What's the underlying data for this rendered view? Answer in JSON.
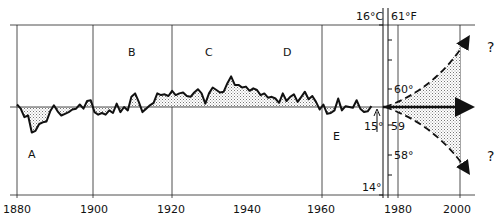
{
  "chart_data": {
    "type": "line",
    "title": "",
    "xlabel": "",
    "ylabel": "",
    "x_ticks": [
      "1880",
      "1900",
      "1920",
      "1940",
      "1960",
      "1980",
      "2000"
    ],
    "xlim": [
      1880,
      2000
    ],
    "celsius_axis": {
      "labels": [
        "16°C",
        "15°",
        "14°"
      ],
      "values": [
        16,
        15,
        14
      ]
    },
    "fahrenheit_axis": {
      "labels": [
        "61°F",
        "60°",
        "59",
        "58°"
      ],
      "values": [
        61,
        60,
        59,
        58
      ]
    },
    "ylim_celsius": [
      14,
      16
    ],
    "baseline_celsius": 15,
    "period_labels": [
      {
        "text": "A",
        "year": 1884,
        "note": "cold minimum"
      },
      {
        "text": "B",
        "year": 1910
      },
      {
        "text": "C",
        "year": 1930
      },
      {
        "text": "D",
        "year": 1952
      },
      {
        "text": "E",
        "year": 1964,
        "note": "cold dip"
      }
    ],
    "series": [
      {
        "name": "Observed temperature anomaly (°C)",
        "x": [
          1880,
          1881,
          1882,
          1883,
          1884,
          1885,
          1886,
          1887,
          1888,
          1889,
          1890,
          1891,
          1892,
          1893,
          1894,
          1895,
          1896,
          1897,
          1898,
          1899,
          1900,
          1901,
          1902,
          1903,
          1904,
          1905,
          1906,
          1907,
          1908,
          1909,
          1910,
          1911,
          1912,
          1913,
          1914,
          1915,
          1916,
          1917,
          1918,
          1919,
          1920,
          1921,
          1922,
          1923,
          1924,
          1925,
          1926,
          1927,
          1928,
          1929,
          1930,
          1931,
          1932,
          1933,
          1934,
          1935,
          1936,
          1937,
          1938,
          1939,
          1940,
          1941,
          1942,
          1943,
          1944,
          1945,
          1946,
          1947,
          1948,
          1949,
          1950,
          1951,
          1952,
          1953,
          1954,
          1955,
          1956,
          1957,
          1958,
          1959,
          1960,
          1961,
          1962,
          1963,
          1964,
          1965,
          1966,
          1967,
          1968,
          1969,
          1970,
          1971,
          1972,
          1973,
          1974,
          1975,
          1976
        ],
        "values": [
          0.03,
          -0.02,
          -0.12,
          -0.1,
          -0.3,
          -0.28,
          -0.2,
          -0.18,
          -0.17,
          -0.05,
          0.02,
          -0.05,
          -0.1,
          -0.08,
          -0.06,
          -0.03,
          -0.02,
          0.03,
          -0.02,
          0.07,
          0.08,
          -0.06,
          -0.09,
          -0.07,
          -0.09,
          -0.04,
          -0.07,
          0.04,
          -0.06,
          0.0,
          -0.04,
          0.12,
          0.16,
          0.06,
          -0.06,
          -0.02,
          0.02,
          0.05,
          0.16,
          0.14,
          0.15,
          0.13,
          0.19,
          0.14,
          0.16,
          0.17,
          0.13,
          0.12,
          0.17,
          0.21,
          0.16,
          0.04,
          0.16,
          0.23,
          0.2,
          0.17,
          0.18,
          0.28,
          0.36,
          0.26,
          0.26,
          0.23,
          0.24,
          0.19,
          0.22,
          0.2,
          0.14,
          0.16,
          0.11,
          0.12,
          0.1,
          0.05,
          0.16,
          0.07,
          0.12,
          0.15,
          0.06,
          0.12,
          0.18,
          0.09,
          0.13,
          0.06,
          -0.03,
          0.03,
          -0.08,
          -0.07,
          -0.04,
          0.1,
          -0.04,
          0.01,
          0.0,
          -0.01,
          0.08,
          -0.02,
          -0.06,
          -0.05,
          0.01
        ]
      },
      {
        "name": "Projection upper (warming)",
        "style": "dashed",
        "x": [
          1976,
          2000
        ],
        "values": [
          0.0,
          0.35
        ],
        "label": "?"
      },
      {
        "name": "Projection level",
        "style": "solid-arrow",
        "x": [
          1976,
          2000
        ],
        "values": [
          0.0,
          0.0
        ]
      },
      {
        "name": "Projection lower (cooling)",
        "style": "dashed",
        "x": [
          1976,
          2000
        ],
        "values": [
          0.0,
          -0.35
        ],
        "label": "?"
      }
    ],
    "grid": true,
    "legend": null,
    "fill": "stippled between curve and 15°C baseline"
  },
  "labels": {
    "A": "A",
    "B": "B",
    "C": "C",
    "D": "D",
    "E": "E",
    "q_up": "?",
    "q_down": "?",
    "c16": "16°C",
    "c15": "15°",
    "c14": "14°",
    "f61": "61°F",
    "f60": "60°",
    "f59": "59",
    "f58": "58°",
    "x1880": "1880",
    "x1900": "1900",
    "x1920": "1920",
    "x1940": "1940",
    "x1960": "1960",
    "x1980": "1980",
    "x2000": "2000"
  }
}
